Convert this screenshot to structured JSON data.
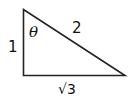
{
  "diagram": {
    "type": "right-triangle",
    "vertices": {
      "top": [
        23.5,
        9.5
      ],
      "bottom_left": [
        23.5,
        75.5
      ],
      "bottom_right": [
        125,
        75.5
      ]
    },
    "labels": {
      "vertical_side": "1",
      "hypotenuse": "2",
      "base": "√3",
      "angle": "θ"
    },
    "stroke_color": "#222222"
  }
}
